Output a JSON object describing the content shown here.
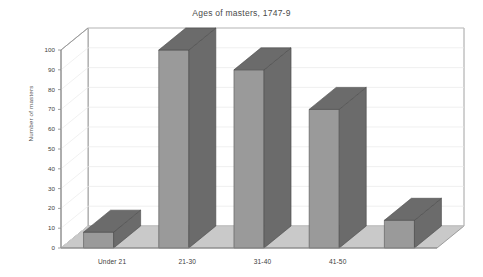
{
  "chart_data": {
    "type": "bar",
    "title": "Ages of masters, 1747-9",
    "xlabel": "",
    "ylabel": "Number of masters",
    "categories": [
      "Under 21",
      "21-30",
      "31-40",
      "41-50",
      ""
    ],
    "values": [
      8,
      100,
      90,
      70,
      14
    ],
    "ylim": [
      0,
      100
    ],
    "ytick_labels": [
      "0",
      "10",
      "20",
      "30",
      "40",
      "50",
      "60",
      "70",
      "80",
      "90",
      "100"
    ],
    "ytick_values": [
      0,
      10,
      20,
      30,
      40,
      50,
      60,
      70,
      80,
      90,
      100
    ],
    "grid": true,
    "legend": false,
    "style": "3d-bars-grayscale",
    "note_last_category_unlabeled": true,
    "colors": {
      "bar_front": "#9a9a9a",
      "bar_top": "#6b6b6b",
      "bar_side": "#6b6b6b",
      "floor": "#c9c9c9",
      "back_wall": "#ffffff",
      "axis_line": "#8a8a8a",
      "grid_line": "#e9e9e9",
      "text": "#3c3c3c",
      "title_text": "#4a4a4a"
    }
  }
}
